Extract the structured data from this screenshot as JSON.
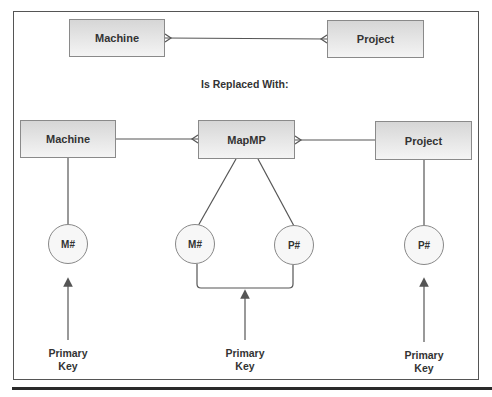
{
  "diagram": {
    "top": {
      "left_entity": "Machine",
      "right_entity": "Project",
      "relationship": "many-to-many"
    },
    "caption": "Is Replaced With:",
    "bottom": {
      "entities": [
        {
          "id": "machine",
          "label": "Machine"
        },
        {
          "id": "mapmp",
          "label": "MapMP"
        },
        {
          "id": "project",
          "label": "Project"
        }
      ],
      "attributes": [
        {
          "id": "machine-m",
          "label": "M#",
          "owner": "Machine"
        },
        {
          "id": "mapmp-m",
          "label": "M#",
          "owner": "MapMP"
        },
        {
          "id": "mapmp-p",
          "label": "P#",
          "owner": "MapMP"
        },
        {
          "id": "project-p",
          "label": "P#",
          "owner": "Project"
        }
      ],
      "key_labels": [
        {
          "line1": "Primary",
          "line2": "Key"
        },
        {
          "line1": "Primary",
          "line2": "Key"
        },
        {
          "line1": "Primary",
          "line2": "Key"
        }
      ]
    },
    "colors": {
      "border": "#555555",
      "line": "#555555",
      "text": "#333333",
      "entity_fill_top": "#d6d6d6",
      "entity_fill_bottom": "#f4f4f4"
    }
  }
}
